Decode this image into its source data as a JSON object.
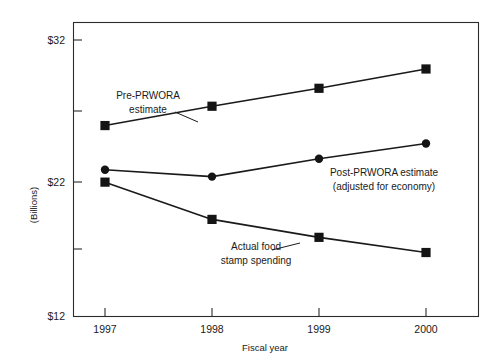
{
  "chart_data": {
    "type": "line",
    "title": "",
    "subtitle": "",
    "xlabel": "Fiscal year",
    "ylabel": "(Billions)",
    "categories": [
      "1997",
      "1998",
      "1999",
      "2000"
    ],
    "x": [
      1997,
      1998,
      1999,
      2000
    ],
    "ylim": [
      12,
      32
    ],
    "y_ticks": [
      12,
      22,
      32
    ],
    "y_tick_labels": [
      "$12",
      "$22",
      "$32"
    ],
    "x_tick_labels": [
      "1997",
      "1998",
      "1999",
      "2000"
    ],
    "grid": false,
    "legend": "annotations-inline",
    "legend_position": "inline",
    "units": "Billions of dollars",
    "series": [
      {
        "name": "Pre-PRWORA estimate",
        "marker": "square",
        "values": [
          25.8,
          27.2,
          28.5,
          29.9
        ]
      },
      {
        "name": "Post-PRWORA estimate (adjusted for economy)",
        "marker": "circle",
        "values": [
          22.6,
          22.1,
          23.4,
          24.5
        ]
      },
      {
        "name": "Actual food stamp spending",
        "marker": "square",
        "values": [
          21.7,
          19.0,
          17.7,
          16.6
        ]
      }
    ],
    "annotations": [
      {
        "id": "pre-prwora",
        "line1": "Pre-PRWORA",
        "line2": "estimate"
      },
      {
        "id": "post-prwora",
        "line1": "Post-PRWORA estimate",
        "line2": "(adjusted for economy)"
      },
      {
        "id": "actual",
        "line1": "Actual food",
        "line2": "stamp spending"
      }
    ]
  },
  "axes": {
    "y_label": "(Billions)",
    "x_label": "Fiscal year",
    "y_ticks": [
      {
        "label": "$32"
      },
      {
        "label": "$22"
      },
      {
        "label": "$12"
      }
    ],
    "x_ticks": [
      {
        "label": "1997"
      },
      {
        "label": "1998"
      },
      {
        "label": "1999"
      },
      {
        "label": "2000"
      }
    ]
  },
  "annotations": {
    "pre_prwora_line1": "Pre-PRWORA",
    "pre_prwora_line2": "estimate",
    "post_prwora_line1": "Post-PRWORA estimate",
    "post_prwora_line2": "(adjusted for economy)",
    "actual_line1": "Actual food",
    "actual_line2": "stamp spending"
  },
  "colors": {
    "ink": "#1a1a1a",
    "frame": "#2b2b2b",
    "background": "#ffffff"
  }
}
